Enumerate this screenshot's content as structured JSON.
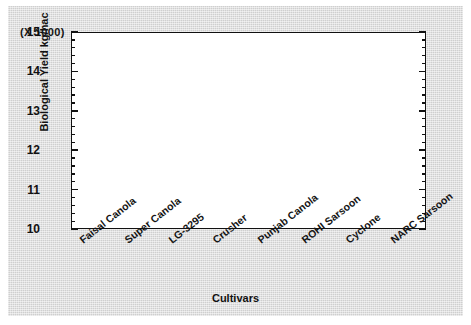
{
  "chart_data": {
    "type": "boxplot",
    "title": "",
    "units_note": "(X 1000)",
    "xlabel": "Cultivars",
    "ylabel": "Biological Yield kg/hac",
    "ylim": [
      10,
      15
    ],
    "yticks": [
      10,
      11,
      12,
      13,
      14,
      15
    ],
    "ytick_labels": [
      "10",
      "11",
      "12",
      "13",
      "14",
      "15"
    ],
    "minor_ticks_per_interval": 5,
    "grid": false,
    "legend": "none",
    "categories": [
      "Faisal Canola",
      "Super Canola",
      "LG-3295",
      "Crusher",
      "Punjab Canola",
      "ROHI Sarsoon",
      "Cyclone",
      "NARC Sarsoon"
    ],
    "boxes": [
      {
        "category": "Faisal Canola",
        "whisker_low": 10.85,
        "q1": 11.15,
        "median": 11.3,
        "q3": 11.75,
        "whisker_high": 11.95,
        "mean": 11.38
      },
      {
        "category": "Super Canola",
        "whisker_low": 10.93,
        "q1": 11.55,
        "median": 12.33,
        "q3": 13.18,
        "whisker_high": 13.95,
        "mean": 12.4
      },
      {
        "category": "LG-3295",
        "whisker_low": 10.82,
        "q1": 11.5,
        "median": 12.23,
        "q3": 12.6,
        "whisker_high": 12.95,
        "mean": 12.03
      },
      {
        "category": "Crusher",
        "whisker_low": 11.38,
        "q1": 11.7,
        "median": 12.37,
        "q3": 12.73,
        "whisker_high": 12.98,
        "mean": 12.17
      },
      {
        "category": "Punjab Canola",
        "whisker_low": 11.38,
        "q1": 11.6,
        "median": 12.48,
        "q3": 13.33,
        "whisker_high": 13.62,
        "mean": 12.48
      },
      {
        "category": "ROHI Sarsoon",
        "whisker_low": 11.55,
        "q1": 11.7,
        "median": 12.62,
        "q3": 13.52,
        "whisker_high": 14.1,
        "mean": 12.65
      },
      {
        "category": "Cyclone",
        "whisker_low": 11.4,
        "q1": 11.72,
        "median": 12.45,
        "q3": 13.1,
        "whisker_high": 13.45,
        "mean": 12.5
      },
      {
        "category": "NARC Sarsoon",
        "whisker_low": 12.03,
        "q1": 12.18,
        "median": 13.15,
        "q3": 13.62,
        "whisker_high": 14.0,
        "mean": 13.05
      }
    ],
    "colors": {
      "box_fill": "#c9c9c4",
      "box_edge": "#3a3f63",
      "mean_marker": "#6b3a22",
      "axis": "#111111",
      "plot_background": "#ffffff",
      "figure_background": "#d7d7d7"
    }
  }
}
